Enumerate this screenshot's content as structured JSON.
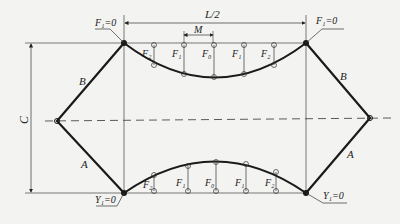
{
  "diagram": {
    "title_dimension": "L/2",
    "spacing_dimension": "M",
    "height_dimension": "C",
    "members": {
      "upper": "B",
      "lower": "A"
    },
    "top_labels": {
      "left_support": "F₁=0",
      "right_support": "F₁=0",
      "stations": [
        "F₂",
        "F₁",
        "F₀",
        "F₁",
        "F₂"
      ]
    },
    "bottom_labels": {
      "left_support": "Y₁=0",
      "right_support": "Y₁=0",
      "stations": [
        "F₂",
        "F₁",
        "F₀",
        "F₁",
        "F₂"
      ]
    },
    "colors": {
      "line": "#1a1a1a",
      "thin": "#444444",
      "background": "#f3f3f1"
    }
  }
}
